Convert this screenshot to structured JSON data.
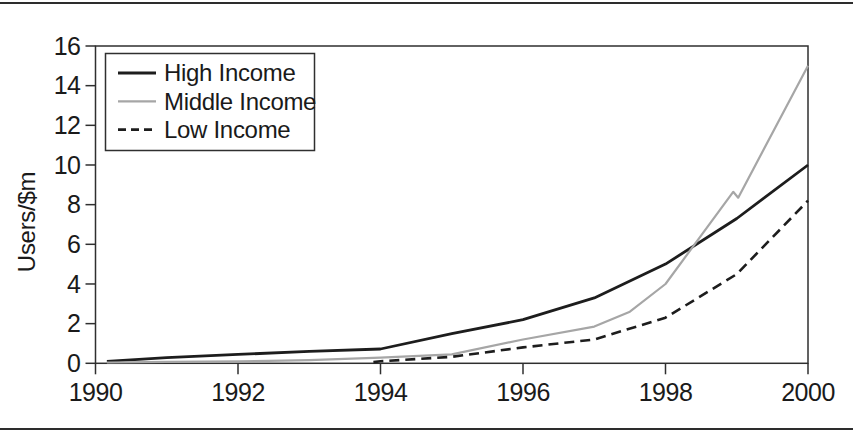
{
  "figure": {
    "type": "scanned-book-line-chart"
  },
  "chart_data": {
    "type": "line",
    "title": "",
    "xlabel": "",
    "ylabel": "Users/$m",
    "xlim": [
      1990,
      2000
    ],
    "ylim": [
      0,
      16
    ],
    "xticks": [
      1990,
      1992,
      1994,
      1996,
      1998,
      2000
    ],
    "yticks": [
      0,
      2,
      4,
      6,
      8,
      10,
      12,
      14,
      16
    ],
    "grid": false,
    "legend_position": "top-left",
    "frame": "full-box",
    "colors": {
      "black_line": "#1d1d1d",
      "gray_line": "#a6a6a6",
      "frame": "#2f2f2f",
      "text": "#1a1a1a"
    },
    "series": [
      {
        "name": "High Income",
        "style": "solid",
        "color": "#1d1d1d",
        "width": 2.8,
        "dash": "",
        "points": [
          [
            1990.16,
            0.1
          ],
          [
            1991,
            0.28
          ],
          [
            1992,
            0.45
          ],
          [
            1993,
            0.6
          ],
          [
            1994,
            0.72
          ],
          [
            1995,
            1.5
          ],
          [
            1996,
            2.2
          ],
          [
            1997,
            3.3
          ],
          [
            1998,
            5.0
          ],
          [
            1999,
            7.3
          ],
          [
            2000,
            10.0
          ]
        ]
      },
      {
        "name": "Middle Income",
        "style": "solid",
        "color": "#a6a6a6",
        "width": 2.2,
        "dash": "",
        "points": [
          [
            1990.16,
            0.04
          ],
          [
            1991,
            0.07
          ],
          [
            1992,
            0.1
          ],
          [
            1993,
            0.16
          ],
          [
            1994,
            0.28
          ],
          [
            1995,
            0.45
          ],
          [
            1996,
            1.2
          ],
          [
            1997,
            1.85
          ],
          [
            1997.5,
            2.6
          ],
          [
            1998,
            4.0
          ],
          [
            1998.95,
            8.65
          ],
          [
            1999.02,
            8.35
          ],
          [
            2000,
            15.0
          ]
        ]
      },
      {
        "name": "Low Income",
        "style": "dashed",
        "color": "#1d1d1d",
        "width": 2.6,
        "dash": "10 6",
        "points": [
          [
            1993.9,
            0.06
          ],
          [
            1994,
            0.1
          ],
          [
            1995,
            0.33
          ],
          [
            1996,
            0.8
          ],
          [
            1997,
            1.2
          ],
          [
            1998,
            2.3
          ],
          [
            1999,
            4.5
          ],
          [
            2000,
            8.2
          ]
        ]
      }
    ]
  }
}
